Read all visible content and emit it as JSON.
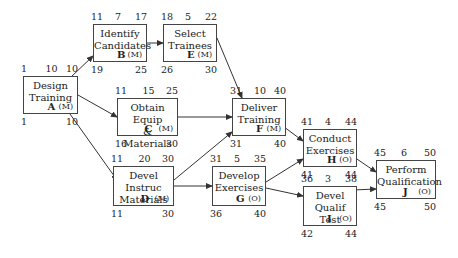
{
  "nodes": [
    {
      "id": "A",
      "line1": "Design",
      "line2": "Training",
      "type": "(M)",
      "es": "1",
      "dur": "10",
      "ef": "10",
      "ls": "1",
      "lf": "10",
      "x": 23,
      "y": 76,
      "w": 55,
      "h": 38
    },
    {
      "id": "B",
      "line1": "Identify",
      "line2": "Candidates",
      "type": "(M)",
      "es": "11",
      "dur": "7",
      "ef": "17",
      "ls": "19",
      "lf": "25",
      "x": 93,
      "y": 24,
      "w": 54,
      "h": 38
    },
    {
      "id": "E",
      "line1": "Select",
      "line2": "Trainees",
      "type": "(M)",
      "es": "18",
      "dur": "5",
      "ef": "22",
      "ls": "26",
      "lf": "30",
      "x": 163,
      "y": 24,
      "w": 54,
      "h": 38
    },
    {
      "id": "C",
      "line1": "Obtain Equip",
      "line2": "& Materials",
      "type": "(M)",
      "es": "11",
      "dur": "15",
      "ef": "25",
      "ls": "16",
      "lf": "30",
      "x": 117,
      "y": 98,
      "w": 61,
      "h": 38
    },
    {
      "id": "F",
      "line1": "Deliver",
      "line2": "Training",
      "type": "(M)",
      "es": "31",
      "dur": "10",
      "ef": "40",
      "ls": "31",
      "lf": "40",
      "x": 232,
      "y": 98,
      "w": 54,
      "h": 38
    },
    {
      "id": "D",
      "line1": "Devel Instruc",
      "line2": "Materials",
      "type": "(M)",
      "es": "11",
      "dur": "20",
      "ef": "30",
      "ls": "11",
      "lf": "30",
      "x": 113,
      "y": 166,
      "w": 61,
      "h": 40
    },
    {
      "id": "G",
      "line1": "Develop",
      "line2": "Exercises",
      "type": "(O)",
      "es": "31",
      "dur": "5",
      "ef": "35",
      "ls": "36",
      "lf": "40",
      "x": 212,
      "y": 166,
      "w": 54,
      "h": 40
    },
    {
      "id": "H",
      "line1": "Conduct",
      "line2": "Exercises",
      "type": "(O)",
      "es": "41",
      "dur": "4",
      "ef": "44",
      "ls": "41",
      "lf": "44",
      "x": 303,
      "y": 129,
      "w": 54,
      "h": 38
    },
    {
      "id": "I",
      "line1": "Devel Qualif",
      "line2": "Test",
      "type": "(O)",
      "es": "36",
      "dur": "3",
      "ef": "38",
      "ls": "42",
      "lf": "44",
      "x": 303,
      "y": 186,
      "w": 54,
      "h": 40
    },
    {
      "id": "J",
      "line1": "Perform",
      "line2": "Qualification",
      "type": "(O)",
      "es": "45",
      "dur": "6",
      "ef": "50",
      "ls": "45",
      "lf": "50",
      "x": 376,
      "y": 160,
      "w": 60,
      "h": 39
    }
  ],
  "edges": [
    [
      "A",
      "B"
    ],
    [
      "A",
      "C"
    ],
    [
      "A",
      "D"
    ],
    [
      "B",
      "E"
    ],
    [
      "E",
      "F"
    ],
    [
      "C",
      "F"
    ],
    [
      "D",
      "F"
    ],
    [
      "D",
      "G"
    ],
    [
      "F",
      "H"
    ],
    [
      "G",
      "H"
    ],
    [
      "G",
      "I"
    ],
    [
      "H",
      "J"
    ],
    [
      "I",
      "J"
    ]
  ],
  "colors": {
    "line": "#333333",
    "box_border": "#444444",
    "text": "#222222"
  }
}
